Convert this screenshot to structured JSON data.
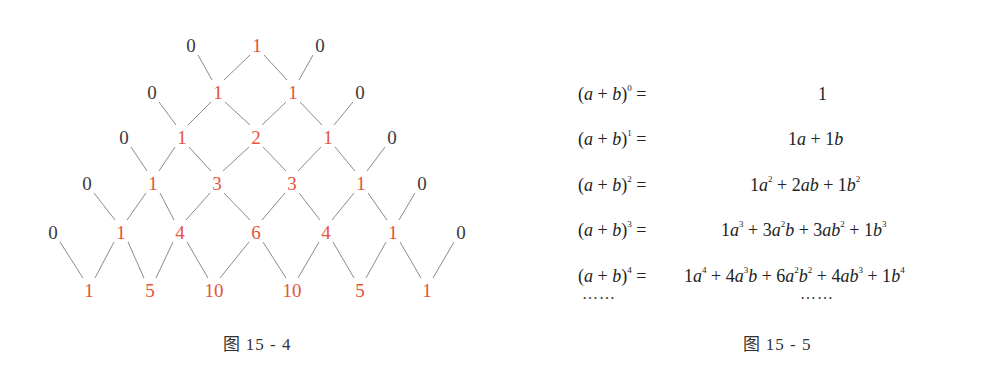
{
  "figure_4": {
    "caption": "图 15 - 4",
    "rows": [
      [
        {
          "v": "0",
          "k": "zero",
          "x": 191,
          "y": 45
        },
        {
          "v": "1",
          "k": "coef",
          "x": 257,
          "y": 45
        },
        {
          "v": "0",
          "k": "zero",
          "x": 320,
          "y": 45
        }
      ],
      [
        {
          "v": "0",
          "k": "zero",
          "x": 152,
          "y": 92
        },
        {
          "v": "1",
          "k": "coef",
          "x": 218,
          "y": 92
        },
        {
          "v": "1",
          "k": "coef",
          "x": 293,
          "y": 92
        },
        {
          "v": "0",
          "k": "zero",
          "x": 360,
          "y": 92
        }
      ],
      [
        {
          "v": "0",
          "k": "zero",
          "x": 124,
          "y": 137
        },
        {
          "v": "1",
          "k": "coef",
          "x": 182,
          "y": 137
        },
        {
          "v": "2",
          "k": "coef",
          "x": 256,
          "y": 137
        },
        {
          "v": "1",
          "k": "coef",
          "x": 328,
          "y": 137
        },
        {
          "v": "0",
          "k": "zero",
          "x": 392,
          "y": 137
        }
      ],
      [
        {
          "v": "0",
          "k": "zero",
          "x": 87,
          "y": 183
        },
        {
          "v": "1",
          "k": "coef",
          "x": 153,
          "y": 183
        },
        {
          "v": "3",
          "k": "coef",
          "x": 217,
          "y": 183
        },
        {
          "v": "3",
          "k": "coef",
          "x": 292,
          "y": 183
        },
        {
          "v": "1",
          "k": "coef",
          "x": 361,
          "y": 183
        },
        {
          "v": "0",
          "k": "zero",
          "x": 422,
          "y": 183
        }
      ],
      [
        {
          "v": "0",
          "k": "zero",
          "x": 53,
          "y": 232
        },
        {
          "v": "1",
          "k": "coef",
          "x": 121,
          "y": 232
        },
        {
          "v": "4",
          "k": "coef",
          "x": 180,
          "y": 232
        },
        {
          "v": "6",
          "k": "coef",
          "x": 256,
          "y": 232
        },
        {
          "v": "4",
          "k": "coef",
          "x": 326,
          "y": 232
        },
        {
          "v": "1",
          "k": "coef",
          "x": 393,
          "y": 232
        },
        {
          "v": "0",
          "k": "zero",
          "x": 461,
          "y": 232
        }
      ],
      [
        {
          "v": "1",
          "k": "coef",
          "x": 89,
          "y": 290
        },
        {
          "v": "5",
          "k": "coef",
          "x": 150,
          "y": 290
        },
        {
          "v": "10",
          "k": "coef",
          "x": 214,
          "y": 290
        },
        {
          "v": "10",
          "k": "coef",
          "x": 292,
          "y": 290
        },
        {
          "v": "5",
          "k": "coef",
          "x": 360,
          "y": 290
        },
        {
          "v": "1",
          "k": "coef",
          "x": 427,
          "y": 290
        }
      ]
    ],
    "colors": {
      "coefficient": "#e5533a",
      "zero": "#3a3a3a",
      "line": "#8a8a8a"
    }
  },
  "figure_5": {
    "caption": "图 15 - 5",
    "equations": [
      {
        "lhs_exp": "0",
        "rhs_html": "1",
        "rhs_x": 240
      },
      {
        "lhs_exp": "1",
        "rhs_html": "1<i>a</i> + 1<i>b</i>",
        "rhs_x": 210
      },
      {
        "lhs_exp": "2",
        "rhs_html": "1<i>a</i><sup>2</sup> + 2<i>ab</i> + 1<i>b</i><sup>2</sup>",
        "rhs_x": 172
      },
      {
        "lhs_exp": "3",
        "rhs_html": "1<i>a</i><sup>3</sup> + 3<i>a</i><sup>2</sup><i>b</i> + 3<i>ab</i><sup>2</sup> + 1<i>b</i><sup>3</sup>",
        "rhs_x": 143
      },
      {
        "lhs_exp": "4",
        "rhs_html": "1<i>a</i><sup>4</sup> + 4<i>a</i><sup>3</sup><i>b</i> + 6<i>a</i><sup>2</sup><i>b</i><sup>2</sup> + 4<i>ab</i><sup>3</sup> + 1<i>b</i><sup>4</sup>",
        "rhs_x": 106
      }
    ],
    "lhs_base": "(a + b)",
    "equals": "=",
    "ellipsis_left": "……",
    "ellipsis_right": "……"
  }
}
